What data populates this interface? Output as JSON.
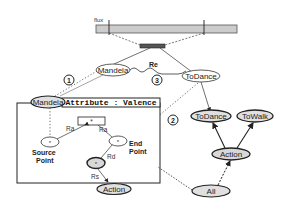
{
  "timeline": {
    "label": "flux",
    "fill": "#cccccc"
  },
  "segment": {
    "fill": "#555555"
  },
  "nodes": {
    "mandela_top": "Mandela",
    "mandela_box": "Mandela",
    "todance_top": "ToDance",
    "todance_hier": "ToDance",
    "towalk": "ToWalk",
    "action_hier": "Action",
    "all": "All",
    "action_box": "Action",
    "star_box": "*",
    "source_node": "*",
    "end_node": "*",
    "mid_node": "*"
  },
  "relation_label": "Re",
  "box": {
    "title": "Attribute : Valence"
  },
  "edge_labels": {
    "ra_left": "Ra",
    "ra_right": "Ra",
    "rd": "Rd",
    "rs": "Rs"
  },
  "point_labels": {
    "source": [
      "Source",
      "Point"
    ],
    "end": [
      "End",
      "Point"
    ]
  },
  "markers": [
    "1",
    "2",
    "3"
  ]
}
